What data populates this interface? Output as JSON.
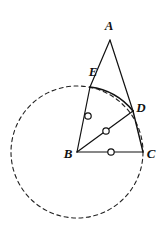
{
  "figure": {
    "type": "euclidean-geometry-diagram",
    "canvas": {
      "width": 165,
      "height": 230
    },
    "colors": {
      "stroke": "#111111",
      "background": "#ffffff",
      "dashed_stroke": "#222222"
    },
    "points": {
      "A": {
        "label": "A",
        "x": 110,
        "y": 40,
        "label_x": 109,
        "label_y": 30
      },
      "B": {
        "label": "B",
        "x": 77,
        "y": 152,
        "label_x": 68,
        "label_y": 158
      },
      "C": {
        "label": "C",
        "x": 143,
        "y": 152,
        "label_x": 151,
        "label_y": 158
      },
      "D": {
        "label": "D",
        "x": 133,
        "y": 111,
        "label_x": 141,
        "label_y": 112
      },
      "E": {
        "label": "E",
        "x": 90,
        "y": 87,
        "label_x": 93,
        "label_y": 76
      }
    },
    "circle": {
      "center_point": "B",
      "cx": 77,
      "cy": 152,
      "radius": 66,
      "style": "dashed",
      "dash_pattern": "4 3.5"
    },
    "segments": [
      {
        "name": "AE",
        "from": "A",
        "to": "E",
        "style": "solid"
      },
      {
        "name": "EB",
        "from": "E",
        "to": "B",
        "style": "solid",
        "tick": "circle"
      },
      {
        "name": "AD",
        "from": "A",
        "to": "D",
        "style": "solid"
      },
      {
        "name": "BD",
        "from": "B",
        "to": "D",
        "style": "solid",
        "tick": "circle"
      },
      {
        "name": "BC",
        "from": "B",
        "to": "C",
        "style": "solid",
        "tick": "circle"
      },
      {
        "name": "DC",
        "from": "D",
        "to": "C",
        "style": "solid"
      }
    ],
    "arc": {
      "name": "arc-ED",
      "from": "E",
      "to": "D",
      "style": "solid",
      "description": "bold arc bulging outward from E to D along the circle"
    },
    "tick_marks": [
      {
        "name": "tick-on-BE",
        "on_segment": "EB",
        "x": 88,
        "y": 116,
        "r": 3.2
      },
      {
        "name": "tick-on-BD",
        "on_segment": "BD",
        "x": 106,
        "y": 131,
        "r": 3.2
      },
      {
        "name": "tick-on-BC",
        "on_segment": "BC",
        "x": 111,
        "y": 152,
        "r": 3.2
      }
    ]
  }
}
